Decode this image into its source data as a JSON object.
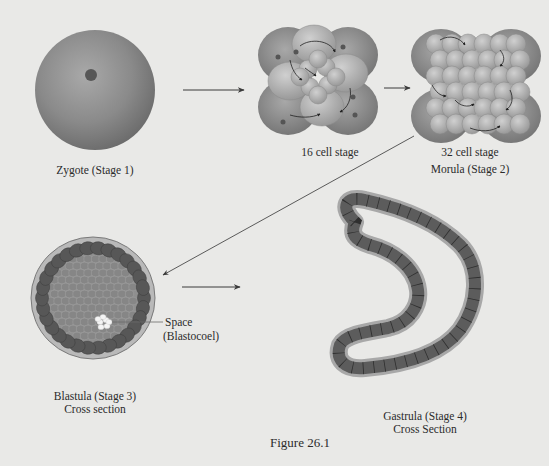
{
  "figure": {
    "caption": "Figure 26.1",
    "stages": {
      "zygote": {
        "label": "Zygote (Stage 1)"
      },
      "cell16": {
        "label": "16 cell stage"
      },
      "cell32": {
        "label": "32 cell stage",
        "sublabel": "Morula (Stage 2)"
      },
      "blastula": {
        "label": "Blastula (Stage 3)",
        "sublabel": "Cross section",
        "annotation_line1": "Space",
        "annotation_line2": "(Blastocoel)"
      },
      "gastrula": {
        "label": "Gastrula (Stage 4)",
        "sublabel": "Cross Section"
      }
    },
    "colors": {
      "background": "#e9e9e7",
      "cell_light": "#b4b4b4",
      "cell_mid": "#8e8e8e",
      "cell_dark": "#5a5a5a",
      "nucleus": "#575757",
      "arrow": "#3a3a3a"
    }
  }
}
